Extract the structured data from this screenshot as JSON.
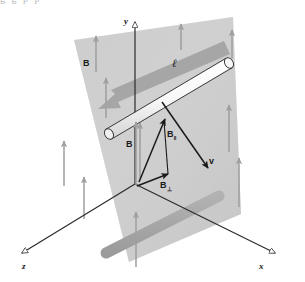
{
  "figure": {
    "axes": {
      "y_label": "y",
      "x_label": "x",
      "z_label": "z"
    },
    "labels": {
      "field_outer": "B",
      "field_vector": "B",
      "field_parallel_base": "B",
      "field_parallel_sub": "‖",
      "field_perpendicular_base": "B",
      "field_perpendicular_sub": "⊥",
      "velocity": "v",
      "length": "ℓ"
    },
    "colors": {
      "plane_fill": "#c9c9c9",
      "plane_fill_light": "#d6d6d6",
      "band_fill": "#a5a5a5",
      "band_dark": "#9a9a9a",
      "rod_fill": "#fbfbfb",
      "rod_stroke": "#2a2a2a",
      "field_arrow": "#9e9e9e",
      "vector_stroke": "#1a1a1a",
      "axis_stroke": "#2b2b2b",
      "text": "#1a1a1a",
      "background": "#ffffff"
    },
    "top_bleed_text": "g g  p p"
  }
}
